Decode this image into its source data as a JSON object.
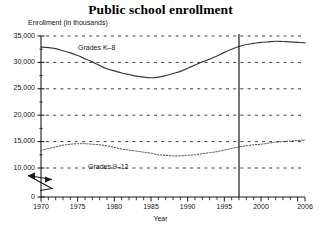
{
  "chart_data": {
    "type": "line",
    "title": "Public school enrollment",
    "xlabel": "Year",
    "ylabel": "Enrollment (in thousands)",
    "xlim": [
      1970,
      2006
    ],
    "ylim": [
      0,
      35000
    ],
    "y_axis_break": true,
    "y_break_between": [
      0,
      10000
    ],
    "grid": true,
    "grid_style": "dashed-horizontal",
    "legend_position": "inline-labels",
    "yticks": [
      0,
      10000,
      15000,
      20000,
      25000,
      30000,
      35000
    ],
    "ytick_labels": [
      "0",
      "10,000",
      "15,000",
      "20,000",
      "25,000",
      "30,000",
      "35,000"
    ],
    "xticks": [
      1970,
      1975,
      1980,
      1985,
      1990,
      1995,
      2000,
      2006
    ],
    "xtick_labels": [
      "1970",
      "1975",
      "1980",
      "1985",
      "1990",
      "1995",
      "2000",
      "2006"
    ],
    "minor_xticks_every": 1,
    "annotations": [
      {
        "name": "reference-line",
        "type": "vertical-line",
        "x": 1997
      }
    ],
    "x": [
      1970,
      1971,
      1972,
      1973,
      1974,
      1975,
      1976,
      1977,
      1978,
      1979,
      1980,
      1981,
      1982,
      1983,
      1984,
      1985,
      1986,
      1987,
      1988,
      1989,
      1990,
      1991,
      1992,
      1993,
      1994,
      1995,
      1996,
      1997,
      1998,
      1999,
      2000,
      2001,
      2002,
      2003,
      2004,
      2005,
      2006
    ],
    "series": [
      {
        "name": "Grades K-8",
        "label": "Grades K–8",
        "style": "solid",
        "color": "#3a3a3a",
        "values": [
          32900,
          32800,
          32600,
          32200,
          31800,
          31300,
          30700,
          30100,
          29400,
          28800,
          28400,
          28000,
          27700,
          27400,
          27200,
          27100,
          27200,
          27500,
          27900,
          28300,
          28900,
          29500,
          30100,
          30600,
          31200,
          31900,
          32500,
          33000,
          33400,
          33600,
          33800,
          33900,
          34000,
          33950,
          33900,
          33800,
          33700
        ]
      },
      {
        "name": "Grades 9-12",
        "label": "Grades 9–12",
        "style": "dotted",
        "color": "#3a3a3a",
        "values": [
          13300,
          13700,
          14000,
          14300,
          14500,
          14600,
          14600,
          14500,
          14400,
          14200,
          13900,
          13600,
          13400,
          13200,
          13000,
          12800,
          12500,
          12400,
          12300,
          12300,
          12400,
          12500,
          12700,
          12900,
          13100,
          13400,
          13700,
          14000,
          14200,
          14400,
          14500,
          14700,
          14900,
          15000,
          15100,
          15200,
          15300
        ]
      }
    ]
  },
  "axis": {
    "break_symbol_name": "y-axis-break"
  }
}
